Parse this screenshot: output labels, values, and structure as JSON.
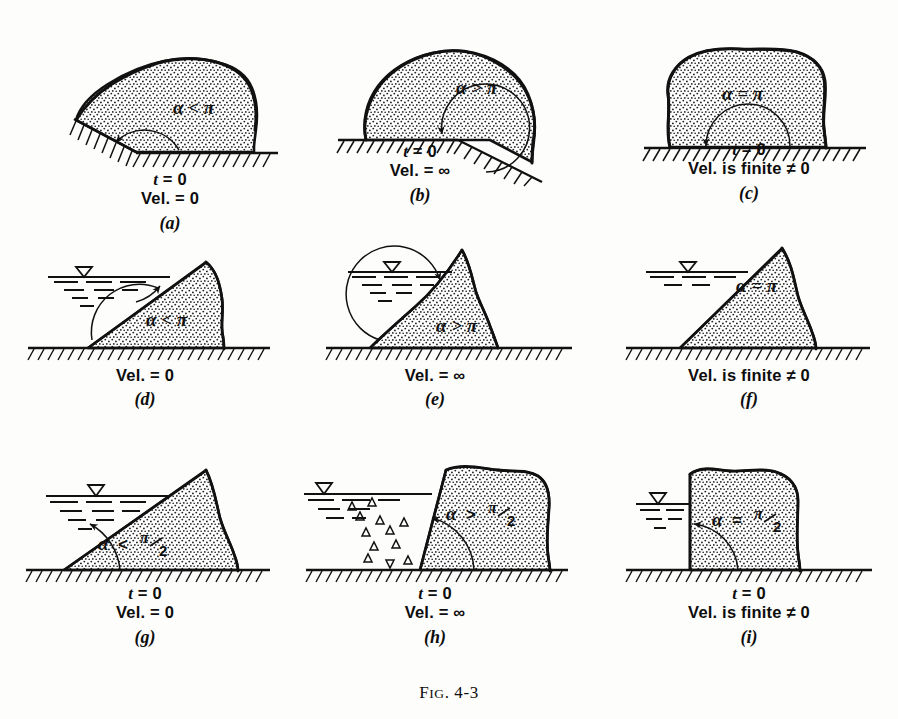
{
  "figure": {
    "caption_prefix": "F",
    "caption_smallcaps": "IG",
    "caption_rest": ". 4-3",
    "caption_full": "FIG. 4-3"
  },
  "symbols": {
    "alpha": "α",
    "pi": "π",
    "less_than": "<",
    "greater_than": ">",
    "equals": "=",
    "infinity": "∞",
    "not_equal": "≠",
    "water_table": "▽",
    "zero": "0"
  },
  "panels": [
    {
      "id": "a",
      "letter": "(a)",
      "angle_label": "α < π",
      "angle_symbol": "α",
      "angle_relation": "<",
      "angle_value": "π",
      "lines": [
        {
          "prefix": "t",
          "rest": " = 0",
          "italic_prefix": true
        },
        {
          "prefix": "",
          "rest": "Vel. = 0",
          "italic_prefix": false
        }
      ],
      "has_water": false,
      "has_time": true,
      "velocity": "0"
    },
    {
      "id": "b",
      "letter": "(b)",
      "angle_label": "α > π",
      "angle_symbol": "α",
      "angle_relation": ">",
      "angle_value": "π",
      "lines": [
        {
          "prefix": "t",
          "rest": " = 0",
          "italic_prefix": true
        },
        {
          "prefix": "",
          "rest": "Vel. = ∞",
          "italic_prefix": false
        }
      ],
      "has_water": false,
      "has_time": true,
      "velocity": "∞"
    },
    {
      "id": "c",
      "letter": "(c)",
      "angle_label": "α = π",
      "angle_symbol": "α",
      "angle_relation": "=",
      "angle_value": "π",
      "lines": [
        {
          "prefix": "t",
          "rest": " = 0",
          "italic_prefix": true
        },
        {
          "prefix": "",
          "rest": "Vel. is finite ≠ 0",
          "italic_prefix": false
        }
      ],
      "has_water": false,
      "has_time": true,
      "velocity": "finite ≠ 0"
    },
    {
      "id": "d",
      "letter": "(d)",
      "angle_label": "α < π",
      "angle_symbol": "α",
      "angle_relation": "<",
      "angle_value": "π",
      "lines": [
        {
          "prefix": "",
          "rest": "Vel. = 0",
          "italic_prefix": false
        }
      ],
      "has_water": true,
      "has_time": false,
      "velocity": "0"
    },
    {
      "id": "e",
      "letter": "(e)",
      "angle_label": "α > π",
      "angle_symbol": "α",
      "angle_relation": ">",
      "angle_value": "π",
      "lines": [
        {
          "prefix": "",
          "rest": "Vel. = ∞",
          "italic_prefix": false
        }
      ],
      "has_water": true,
      "has_time": false,
      "velocity": "∞"
    },
    {
      "id": "f",
      "letter": "(f)",
      "angle_label": "α = π",
      "angle_symbol": "α",
      "angle_relation": "=",
      "angle_value": "π",
      "lines": [
        {
          "prefix": "",
          "rest": "Vel. is finite ≠ 0",
          "italic_prefix": false
        }
      ],
      "has_water": true,
      "has_time": false,
      "velocity": "finite ≠ 0"
    },
    {
      "id": "g",
      "letter": "(g)",
      "angle_label": "α < π/2",
      "angle_symbol": "α",
      "angle_relation": "<",
      "angle_value": "π/2",
      "lines": [
        {
          "prefix": "t",
          "rest": " = 0",
          "italic_prefix": true
        },
        {
          "prefix": "",
          "rest": "Vel. = 0",
          "italic_prefix": false
        }
      ],
      "has_water": true,
      "has_time": true,
      "velocity": "0"
    },
    {
      "id": "h",
      "letter": "(h)",
      "angle_label": "α > π/2",
      "angle_symbol": "α",
      "angle_relation": ">",
      "angle_value": "π/2",
      "lines": [
        {
          "prefix": "t",
          "rest": " = 0",
          "italic_prefix": true
        },
        {
          "prefix": "",
          "rest": "Vel. = ∞",
          "italic_prefix": false
        }
      ],
      "has_water": true,
      "has_time": true,
      "velocity": "∞"
    },
    {
      "id": "i",
      "letter": "(i)",
      "angle_label": "α = π/2",
      "angle_symbol": "α",
      "angle_relation": "=",
      "angle_value": "π/2",
      "lines": [
        {
          "prefix": "t",
          "rest": " = 0",
          "italic_prefix": true
        },
        {
          "prefix": "",
          "rest": "Vel. is finite ≠ 0",
          "italic_prefix": false
        }
      ],
      "has_water": true,
      "has_time": true,
      "velocity": "finite ≠ 0"
    }
  ],
  "colors": {
    "ink": "#111111",
    "paper": "#fdfdfb",
    "stipple": "#2b2b2b"
  }
}
